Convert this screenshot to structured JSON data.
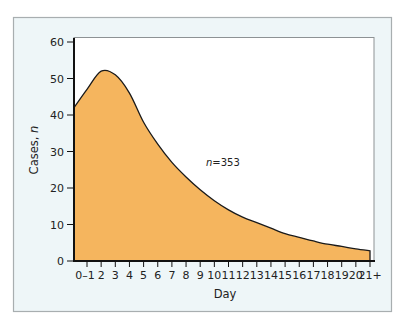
{
  "chart_data": {
    "type": "area",
    "title": "",
    "xlabel": "Day",
    "ylabel": "Cases, n",
    "ylabel_main": "Cases, ",
    "ylabel_italic": "n",
    "ylim": [
      0,
      60
    ],
    "yticks": [
      0,
      10,
      20,
      30,
      40,
      50,
      60
    ],
    "categories": [
      "0–1",
      "2",
      "3",
      "4",
      "5",
      "6",
      "7",
      "8",
      "9",
      "10",
      "11",
      "12",
      "13",
      "14",
      "15",
      "16",
      "17",
      "18",
      "19",
      "20",
      "21+"
    ],
    "values": [
      47,
      52,
      51,
      46,
      38,
      32,
      27,
      23,
      19.5,
      16.5,
      14,
      12,
      10.5,
      9,
      7.5,
      6.5,
      5.5,
      4.6,
      4,
      3.3,
      2.8
    ],
    "start_value": 42,
    "annotation": {
      "italic": "n",
      "text": "=353"
    },
    "grid": false,
    "fill_color": "#f5b55e",
    "line_color": "#1a1a1a",
    "panel_color": "#eef6f8"
  }
}
